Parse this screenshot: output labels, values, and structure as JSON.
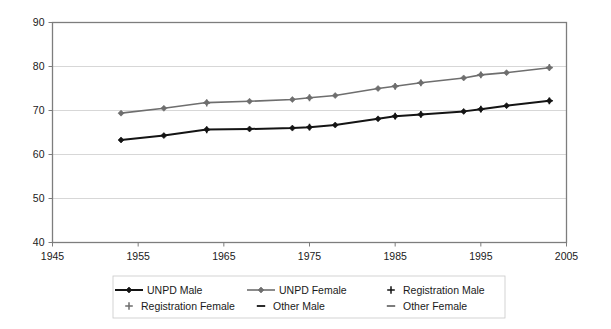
{
  "chart_data": {
    "type": "line",
    "title": "",
    "subtitle": "",
    "xlabel": "",
    "ylabel": "",
    "xlim": [
      1945,
      2005
    ],
    "ylim": [
      40,
      90
    ],
    "xticks": [
      1945,
      1955,
      1965,
      1975,
      1985,
      1995,
      2005
    ],
    "yticks": [
      40,
      50,
      60,
      70,
      80,
      90
    ],
    "grid": "horizontal",
    "legend_position": "bottom",
    "series": [
      {
        "name": "UNPD Male",
        "marker": "diamond",
        "color": "#141414",
        "line_width": 2.0,
        "x": [
          1953,
          1958,
          1963,
          1968,
          1973,
          1975,
          1978,
          1983,
          1985,
          1988,
          1993,
          1995,
          1998,
          2003
        ],
        "values": [
          63.3,
          64.3,
          65.7,
          65.8,
          66.0,
          66.2,
          66.7,
          68.1,
          68.7,
          69.1,
          69.8,
          70.3,
          71.1,
          72.2
        ]
      },
      {
        "name": "UNPD Female",
        "marker": "diamond",
        "color": "#6e6e6e",
        "line_width": 1.6,
        "x": [
          1953,
          1958,
          1963,
          1968,
          1973,
          1975,
          1978,
          1983,
          1985,
          1988,
          1993,
          1995,
          1998,
          2003
        ],
        "values": [
          69.4,
          70.5,
          71.8,
          72.1,
          72.5,
          72.9,
          73.4,
          75.0,
          75.5,
          76.3,
          77.4,
          78.1,
          78.6,
          79.7
        ]
      },
      {
        "name": "Registration Male",
        "marker": "plus",
        "color": "#141414",
        "line_width": 0,
        "x": [
          1963,
          1975,
          1985,
          1988,
          1995,
          2003
        ],
        "values": [
          65.6,
          66.2,
          68.7,
          69.1,
          70.3,
          72.2
        ]
      },
      {
        "name": "Registration Female",
        "marker": "plus",
        "color": "#6e6e6e",
        "line_width": 0,
        "x": [
          1963,
          1975,
          1985,
          1988,
          1995,
          2003
        ],
        "values": [
          71.7,
          72.9,
          75.5,
          76.3,
          78.1,
          79.8
        ]
      },
      {
        "name": "Other Male",
        "marker": "dash",
        "color": "#141414",
        "line_width": 0,
        "x": [],
        "values": []
      },
      {
        "name": "Other Female",
        "marker": "dash",
        "color": "#6e6e6e",
        "line_width": 0,
        "x": [],
        "values": []
      }
    ]
  },
  "legend": {
    "entries": [
      {
        "label": "UNPD Male",
        "marker": "line-diamond",
        "color": "#141414"
      },
      {
        "label": "UNPD Female",
        "marker": "line-diamond",
        "color": "#6e6e6e"
      },
      {
        "label": "Registration Male",
        "marker": "plus",
        "color": "#141414"
      },
      {
        "label": "Registration Female",
        "marker": "plus",
        "color": "#6e6e6e"
      },
      {
        "label": "Other Male",
        "marker": "dash",
        "color": "#141414"
      },
      {
        "label": "Other Female",
        "marker": "dash",
        "color": "#6e6e6e"
      }
    ]
  },
  "colors": {
    "male": "#141414",
    "female": "#6e6e6e",
    "frame": "#7d7d7d",
    "grid": "#d3d3d3",
    "background": "#ffffff",
    "text": "#1a1a1a"
  }
}
